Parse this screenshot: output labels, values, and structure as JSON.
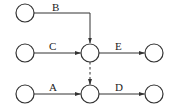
{
  "diagram": {
    "type": "activity-on-arrow network",
    "nodes": [
      {
        "id": "n1"
      },
      {
        "id": "n2"
      },
      {
        "id": "n3"
      },
      {
        "id": "n4"
      },
      {
        "id": "n5"
      },
      {
        "id": "n6"
      },
      {
        "id": "n7"
      }
    ],
    "edges": [
      {
        "id": "B",
        "label": "B",
        "from": "n1",
        "to": "n3",
        "style": "solid"
      },
      {
        "id": "C",
        "label": "C",
        "from": "n2",
        "to": "n3",
        "style": "solid"
      },
      {
        "id": "E",
        "label": "E",
        "from": "n3",
        "to": "n4",
        "style": "solid"
      },
      {
        "id": "A",
        "label": "A",
        "from": "n5",
        "to": "n6",
        "style": "solid"
      },
      {
        "id": "D",
        "label": "D",
        "from": "n6",
        "to": "n7",
        "style": "solid"
      },
      {
        "id": "dummy",
        "label": "",
        "from": "n3",
        "to": "n6",
        "style": "dashed"
      }
    ]
  }
}
